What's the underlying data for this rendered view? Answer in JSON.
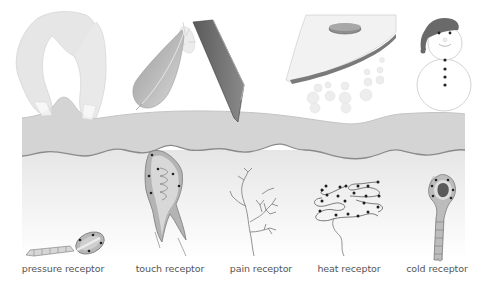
{
  "diagram": {
    "colors": {
      "skin_top": "#d6d6d6",
      "skin_line": "#8a8a8a",
      "dermis": "#efefef",
      "receptor_fill": "#c8c8c8",
      "dark": "#3c3c3c",
      "label_text": "#555555"
    },
    "stimuli": [
      {
        "id": "fingers",
        "name": "pinching fingers"
      },
      {
        "id": "feather",
        "name": "feather"
      },
      {
        "id": "knife",
        "name": "knife blade"
      },
      {
        "id": "iron",
        "name": "hot iron with steam"
      },
      {
        "id": "snowman",
        "name": "snowman"
      }
    ],
    "labels": [
      {
        "text": "pressure receptor",
        "x": 63
      },
      {
        "text": "touch receptor",
        "x": 170
      },
      {
        "text": "pain receptor",
        "x": 261
      },
      {
        "text": "heat receptor",
        "x": 349
      },
      {
        "text": "cold receptor",
        "x": 437
      }
    ]
  }
}
